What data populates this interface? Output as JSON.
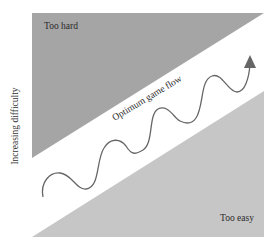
{
  "diagram": {
    "y_axis_label": "Increasing difficulty",
    "zones": {
      "too_hard": {
        "label": "Too hard",
        "color": "#a5a5a5"
      },
      "too_easy": {
        "label": "Too easy",
        "color": "#c6c6c6"
      },
      "flow_channel": {
        "label": "Optimum game flow",
        "color": "#ffffff"
      }
    },
    "path": {
      "description": "wavy line oscillating upward within flow channel ending in arrowhead",
      "color": "#666666"
    }
  }
}
